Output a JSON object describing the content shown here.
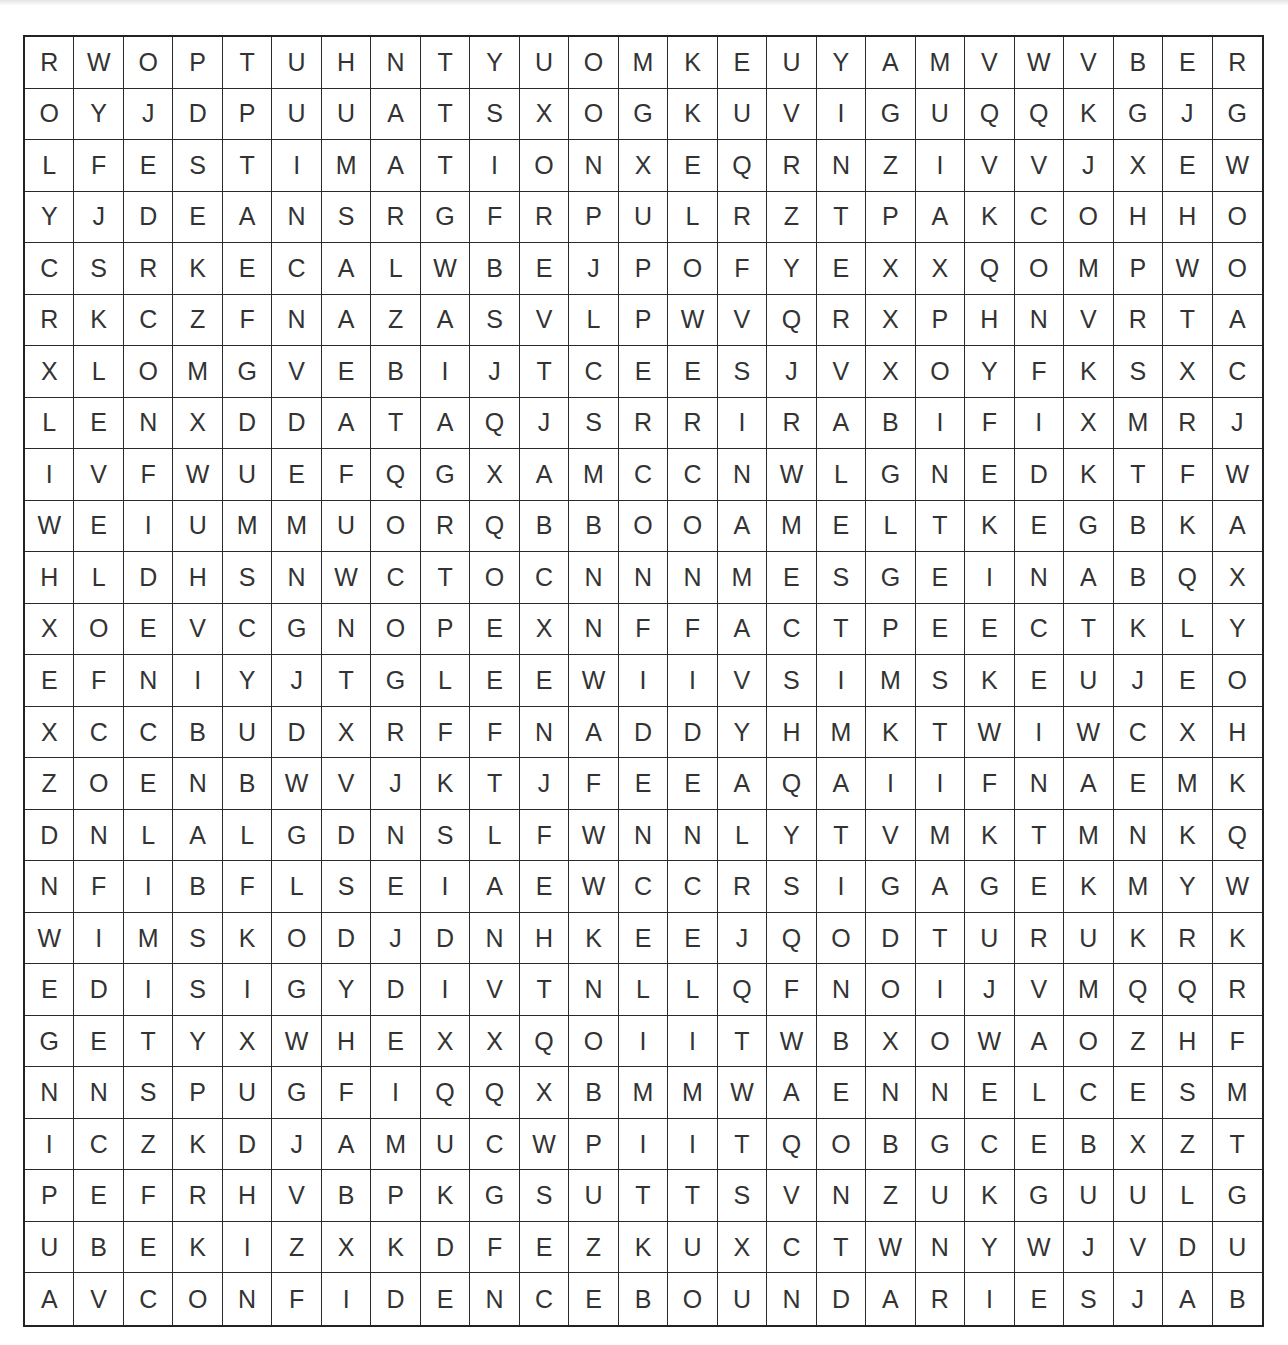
{
  "puzzle": {
    "type": "word-search",
    "rows": 25,
    "cols": 25,
    "grid": [
      [
        "R",
        "W",
        "O",
        "P",
        "T",
        "U",
        "H",
        "N",
        "T",
        "Y",
        "U",
        "O",
        "M",
        "K",
        "E",
        "U",
        "Y",
        "A",
        "M",
        "V",
        "W",
        "V",
        "B",
        "E",
        "R"
      ],
      [
        "O",
        "Y",
        "J",
        "D",
        "P",
        "U",
        "U",
        "A",
        "T",
        "S",
        "X",
        "O",
        "G",
        "K",
        "U",
        "V",
        "I",
        "G",
        "U",
        "Q",
        "Q",
        "K",
        "G",
        "J",
        "G"
      ],
      [
        "L",
        "F",
        "E",
        "S",
        "T",
        "I",
        "M",
        "A",
        "T",
        "I",
        "O",
        "N",
        "X",
        "E",
        "Q",
        "R",
        "N",
        "Z",
        "I",
        "V",
        "V",
        "J",
        "X",
        "E",
        "W"
      ],
      [
        "Y",
        "J",
        "D",
        "E",
        "A",
        "N",
        "S",
        "R",
        "G",
        "F",
        "R",
        "P",
        "U",
        "L",
        "R",
        "Z",
        "T",
        "P",
        "A",
        "K",
        "C",
        "O",
        "H",
        "H",
        "O"
      ],
      [
        "C",
        "S",
        "R",
        "K",
        "E",
        "C",
        "A",
        "L",
        "W",
        "B",
        "E",
        "J",
        "P",
        "O",
        "F",
        "Y",
        "E",
        "X",
        "X",
        "Q",
        "O",
        "M",
        "P",
        "W",
        "O"
      ],
      [
        "R",
        "K",
        "C",
        "Z",
        "F",
        "N",
        "A",
        "Z",
        "A",
        "S",
        "V",
        "L",
        "P",
        "W",
        "V",
        "Q",
        "R",
        "X",
        "P",
        "H",
        "N",
        "V",
        "R",
        "T",
        "A"
      ],
      [
        "X",
        "L",
        "O",
        "M",
        "G",
        "V",
        "E",
        "B",
        "I",
        "J",
        "T",
        "C",
        "E",
        "E",
        "S",
        "J",
        "V",
        "X",
        "O",
        "Y",
        "F",
        "K",
        "S",
        "X",
        "C"
      ],
      [
        "L",
        "E",
        "N",
        "X",
        "D",
        "D",
        "A",
        "T",
        "A",
        "Q",
        "J",
        "S",
        "R",
        "R",
        "I",
        "R",
        "A",
        "B",
        "I",
        "F",
        "I",
        "X",
        "M",
        "R",
        "J"
      ],
      [
        "I",
        "V",
        "F",
        "W",
        "U",
        "E",
        "F",
        "Q",
        "G",
        "X",
        "A",
        "M",
        "C",
        "C",
        "N",
        "W",
        "L",
        "G",
        "N",
        "E",
        "D",
        "K",
        "T",
        "F",
        "W"
      ],
      [
        "W",
        "E",
        "I",
        "U",
        "M",
        "M",
        "U",
        "O",
        "R",
        "Q",
        "B",
        "B",
        "O",
        "O",
        "A",
        "M",
        "E",
        "L",
        "T",
        "K",
        "E",
        "G",
        "B",
        "K",
        "A"
      ],
      [
        "H",
        "L",
        "D",
        "H",
        "S",
        "N",
        "W",
        "C",
        "T",
        "O",
        "C",
        "N",
        "N",
        "N",
        "M",
        "E",
        "S",
        "G",
        "E",
        "I",
        "N",
        "A",
        "B",
        "Q",
        "X"
      ],
      [
        "X",
        "O",
        "E",
        "V",
        "C",
        "G",
        "N",
        "O",
        "P",
        "E",
        "X",
        "N",
        "F",
        "F",
        "A",
        "C",
        "T",
        "P",
        "E",
        "E",
        "C",
        "T",
        "K",
        "L",
        "Y"
      ],
      [
        "E",
        "F",
        "N",
        "I",
        "Y",
        "J",
        "T",
        "G",
        "L",
        "E",
        "E",
        "W",
        "I",
        "I",
        "V",
        "S",
        "I",
        "M",
        "S",
        "K",
        "E",
        "U",
        "J",
        "E",
        "O"
      ],
      [
        "X",
        "C",
        "C",
        "B",
        "U",
        "D",
        "X",
        "R",
        "F",
        "F",
        "N",
        "A",
        "D",
        "D",
        "Y",
        "H",
        "M",
        "K",
        "T",
        "W",
        "I",
        "W",
        "C",
        "X",
        "H"
      ],
      [
        "Z",
        "O",
        "E",
        "N",
        "B",
        "W",
        "V",
        "J",
        "K",
        "T",
        "J",
        "F",
        "E",
        "E",
        "A",
        "Q",
        "A",
        "I",
        "I",
        "F",
        "N",
        "A",
        "E",
        "M",
        "K"
      ],
      [
        "D",
        "N",
        "L",
        "A",
        "L",
        "G",
        "D",
        "N",
        "S",
        "L",
        "F",
        "W",
        "N",
        "N",
        "L",
        "Y",
        "T",
        "V",
        "M",
        "K",
        "T",
        "M",
        "N",
        "K",
        "Q"
      ],
      [
        "N",
        "F",
        "I",
        "B",
        "F",
        "L",
        "S",
        "E",
        "I",
        "A",
        "E",
        "W",
        "C",
        "C",
        "R",
        "S",
        "I",
        "G",
        "A",
        "G",
        "E",
        "K",
        "M",
        "Y",
        "W"
      ],
      [
        "W",
        "I",
        "M",
        "S",
        "K",
        "O",
        "D",
        "J",
        "D",
        "N",
        "H",
        "K",
        "E",
        "E",
        "J",
        "Q",
        "O",
        "D",
        "T",
        "U",
        "R",
        "U",
        "K",
        "R",
        "K"
      ],
      [
        "E",
        "D",
        "I",
        "S",
        "I",
        "G",
        "Y",
        "D",
        "I",
        "V",
        "T",
        "N",
        "L",
        "L",
        "Q",
        "F",
        "N",
        "O",
        "I",
        "J",
        "V",
        "M",
        "Q",
        "Q",
        "R"
      ],
      [
        "G",
        "E",
        "T",
        "Y",
        "X",
        "W",
        "H",
        "E",
        "X",
        "X",
        "Q",
        "O",
        "I",
        "I",
        "T",
        "W",
        "B",
        "X",
        "O",
        "W",
        "A",
        "O",
        "Z",
        "H",
        "F"
      ],
      [
        "N",
        "N",
        "S",
        "P",
        "U",
        "G",
        "F",
        "I",
        "Q",
        "Q",
        "X",
        "B",
        "M",
        "M",
        "W",
        "A",
        "E",
        "N",
        "N",
        "E",
        "L",
        "C",
        "E",
        "S",
        "M"
      ],
      [
        "I",
        "C",
        "Z",
        "K",
        "D",
        "J",
        "A",
        "M",
        "U",
        "C",
        "W",
        "P",
        "I",
        "I",
        "T",
        "Q",
        "O",
        "B",
        "G",
        "C",
        "E",
        "B",
        "X",
        "Z",
        "T"
      ],
      [
        "P",
        "E",
        "F",
        "R",
        "H",
        "V",
        "B",
        "P",
        "K",
        "G",
        "S",
        "U",
        "T",
        "T",
        "S",
        "V",
        "N",
        "Z",
        "U",
        "K",
        "G",
        "U",
        "U",
        "L",
        "G"
      ],
      [
        "U",
        "B",
        "E",
        "K",
        "I",
        "Z",
        "X",
        "K",
        "D",
        "F",
        "E",
        "Z",
        "K",
        "U",
        "X",
        "C",
        "T",
        "W",
        "N",
        "Y",
        "W",
        "J",
        "V",
        "D",
        "U"
      ],
      [
        "A",
        "V",
        "C",
        "O",
        "N",
        "F",
        "I",
        "D",
        "E",
        "N",
        "C",
        "E",
        "B",
        "O",
        "U",
        "N",
        "D",
        "A",
        "R",
        "I",
        "E",
        "S",
        "J",
        "A",
        "B"
      ]
    ]
  }
}
